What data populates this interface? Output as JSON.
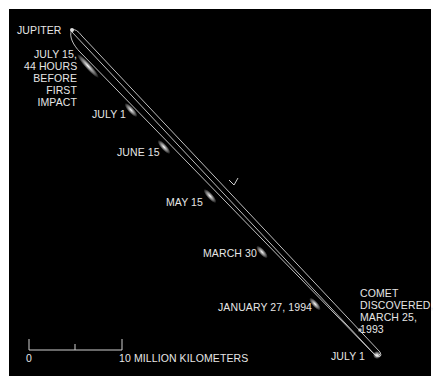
{
  "colors": {
    "background": "#000000",
    "orbit": "#c8c8c8",
    "text": "#e6e6e6",
    "border": "#ffffff"
  },
  "labels": {
    "jupiter": "JUPITER",
    "july15": [
      "JULY 15,",
      "44 HOURS",
      "BEFORE",
      "FIRST",
      "IMPACT"
    ],
    "july1_top": "JULY 1",
    "june15": "JUNE 15",
    "may15": "MAY 15",
    "march30": "MARCH 30",
    "jan27": "JANUARY 27, 1994",
    "discovered": [
      "COMET",
      "DISCOVERED,",
      "MARCH 25,",
      "1993"
    ],
    "july1_bottom": "JULY 1"
  },
  "scale_bar": {
    "zero": "0",
    "end_label": "10 MILLION KILOMETERS"
  },
  "icons": {
    "direction_arrow": "chevron-arrow-icon"
  }
}
